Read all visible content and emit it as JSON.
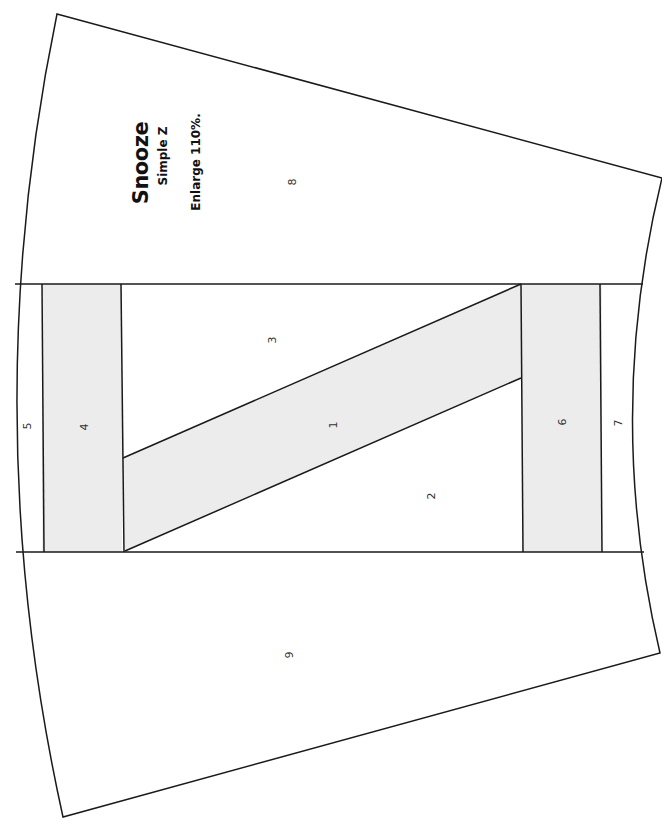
{
  "pattern": {
    "title": "Snooze",
    "subtitle": "Simple Z",
    "note": "Enlarge 110%.",
    "fill_color_shaded": "#ececec",
    "fill_color_plain": "#ffffff",
    "line_color": "#1a1a1a",
    "pieces": [
      {
        "id": "1",
        "label": "1",
        "shaded": true
      },
      {
        "id": "2",
        "label": "2",
        "shaded": false
      },
      {
        "id": "3",
        "label": "3",
        "shaded": false
      },
      {
        "id": "4",
        "label": "4",
        "shaded": true
      },
      {
        "id": "5",
        "label": "5",
        "shaded": false
      },
      {
        "id": "6",
        "label": "6",
        "shaded": true
      },
      {
        "id": "7",
        "label": "7",
        "shaded": false
      },
      {
        "id": "8",
        "label": "8",
        "shaded": false
      },
      {
        "id": "9",
        "label": "9",
        "shaded": false
      }
    ]
  }
}
